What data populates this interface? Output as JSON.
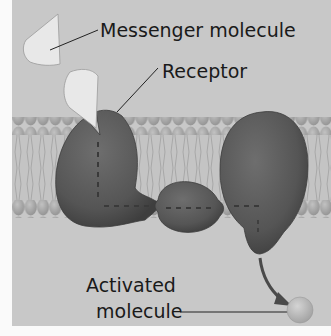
{
  "diagram": {
    "labels": {
      "messenger": "Messenger molecule",
      "receptor": "Receptor",
      "activated_line1": "Activated",
      "activated_line2": "molecule"
    },
    "colors": {
      "background": "#c8c8c8",
      "frame_white": "#f4f4f4",
      "membrane_head": "#a9a9a9",
      "membrane_tail": "#bdbdbd",
      "protein": "#5e5e5e",
      "protein_dark": "#474747",
      "messenger": "#e6e6e6",
      "activated_molecule": "#b8b8b8",
      "arrow": "#4a4a4a",
      "text": "#1a1a1a"
    }
  }
}
